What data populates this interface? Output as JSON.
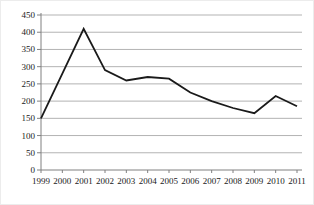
{
  "window": {
    "background": "#ffffff",
    "border_color": "#ececec"
  },
  "chart_data": {
    "type": "line",
    "title": "",
    "xlabel": "",
    "ylabel": "",
    "legend": "none",
    "grid": "horizontal",
    "x_labels": [
      "1999",
      "2000",
      "2001",
      "2002",
      "2003",
      "2004",
      "2005",
      "2006",
      "2007",
      "2008",
      "2009",
      "2010",
      "2011"
    ],
    "series": [
      {
        "name": "series-1",
        "values": [
          150,
          280,
          410,
          290,
          260,
          270,
          265,
          225,
          200,
          180,
          165,
          215,
          185
        ],
        "color": "#1a1a1a"
      }
    ],
    "ylim": [
      0,
      450
    ],
    "ytick_step": 50,
    "y_tick_labels": [
      "0",
      "50",
      "100",
      "150",
      "200",
      "250",
      "300",
      "350",
      "400",
      "450"
    ],
    "axis_color": "#808080",
    "grid_color": "#b3b3b3",
    "label_color": "#1a1a1a"
  }
}
